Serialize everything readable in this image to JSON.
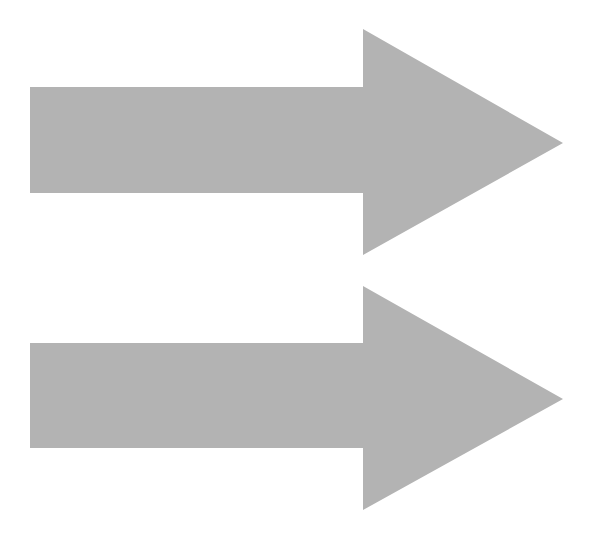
{
  "canvas": {
    "width": 596,
    "height": 550,
    "background": "#ffffff"
  },
  "arrows": [
    {
      "name": "top-arrow",
      "direction": "right",
      "fill": "#b3b3b3",
      "points": "30,87 363,87 363,29 563,143 363,255 363,193 30,193"
    },
    {
      "name": "bottom-arrow",
      "direction": "right",
      "fill": "#b3b3b3",
      "points": "30,343 363,343 363,286 563,399 363,510 363,448 30,448"
    }
  ]
}
